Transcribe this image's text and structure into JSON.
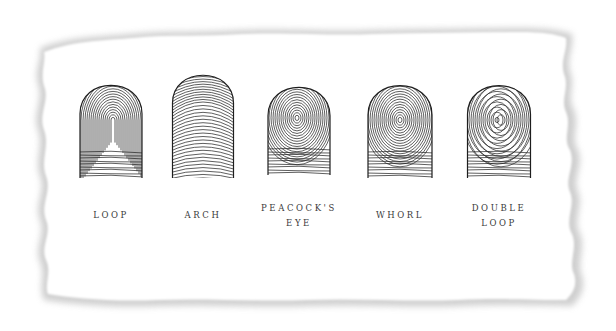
{
  "figure": {
    "background_color": "#ffffff",
    "paper_color": "#ffffff",
    "shadow_color": "#c8c8c8",
    "ink_color": "#2a2a2a",
    "fingerprints": [
      {
        "type": "loop",
        "label_lines": [
          "LOOP"
        ],
        "cx": 111,
        "top": 78,
        "bottom": 178,
        "width": 62,
        "pattern": "loop"
      },
      {
        "type": "arch",
        "label_lines": [
          "ARCH"
        ],
        "cx": 203,
        "top": 68,
        "bottom": 178,
        "width": 61,
        "pattern": "arch"
      },
      {
        "type": "peacocks-eye",
        "label_lines": [
          "PEACOCK'S",
          "EYE"
        ],
        "cx": 299,
        "top": 80,
        "bottom": 175,
        "width": 62,
        "pattern": "peacock"
      },
      {
        "type": "whorl",
        "label_lines": [
          "WHORL"
        ],
        "cx": 400,
        "top": 78,
        "bottom": 178,
        "width": 64,
        "pattern": "whorl"
      },
      {
        "type": "double-loop",
        "label_lines": [
          "DOUBLE",
          "LOOP"
        ],
        "cx": 499,
        "top": 78,
        "bottom": 178,
        "width": 63,
        "pattern": "double"
      }
    ]
  }
}
